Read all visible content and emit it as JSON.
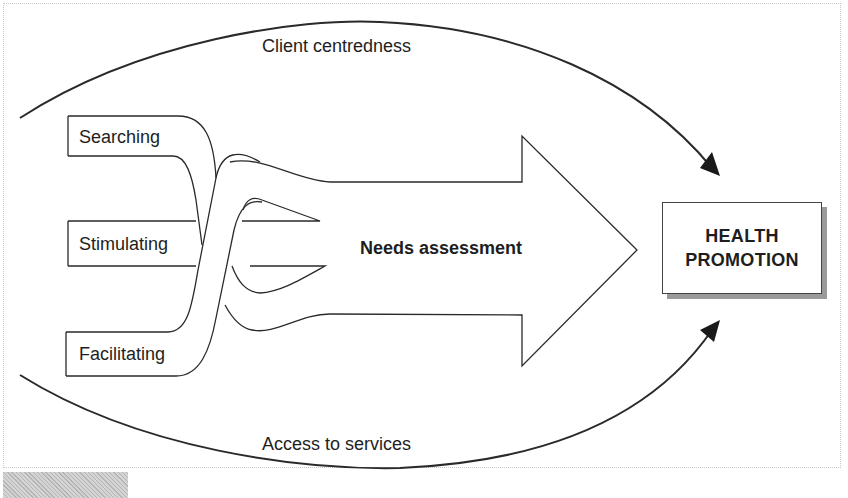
{
  "diagram": {
    "top_arc": {
      "label": "Client centredness"
    },
    "bottom_arc": {
      "label": "Access to services"
    },
    "branches": [
      {
        "label": "Searching"
      },
      {
        "label": "Stimulating"
      },
      {
        "label": "Facilitating"
      }
    ],
    "main_arrow": {
      "label": "Needs assessment"
    },
    "target": {
      "line1": "HEALTH",
      "line2": "PROMOTION"
    },
    "colors": {
      "stroke": "#2a2a2a",
      "text": "#1e1e1e",
      "shadow": "#9a9a9a",
      "background": "#ffffff"
    }
  }
}
